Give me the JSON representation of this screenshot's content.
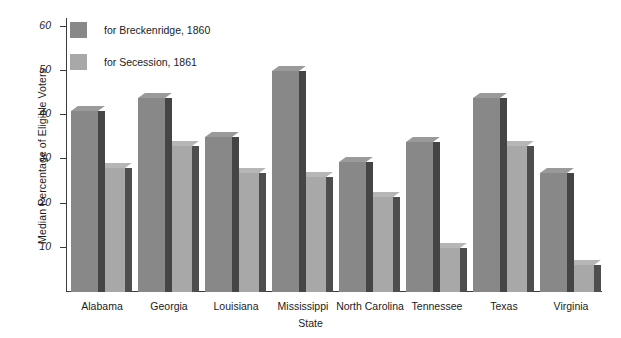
{
  "chart_data": {
    "type": "bar",
    "title": "",
    "xlabel": "State",
    "ylabel": "Median Percentage of Eligible Voters",
    "categories": [
      "Alabama",
      "Georgia",
      "Louisiana",
      "Mississippi",
      "North Carolina",
      "Tennessee",
      "Texas",
      "Virginia"
    ],
    "series": [
      {
        "name": "for Breckenridge, 1860",
        "color": "#888888",
        "values": [
          41,
          44,
          35,
          50,
          29.5,
          34,
          44,
          27
        ]
      },
      {
        "name": "for Secession, 1861",
        "color": "#a8a8a8",
        "values": [
          28,
          33,
          27,
          26,
          21.5,
          10,
          33,
          6
        ]
      }
    ],
    "ylim": [
      0,
      62
    ],
    "yticks": [
      10,
      20,
      30,
      40,
      50,
      60
    ],
    "ytick_labels": [
      "10",
      "20",
      "30",
      "40",
      "50",
      "60"
    ],
    "grid": false,
    "legend_position": "upper-left-inside",
    "style": "3d-bar"
  }
}
